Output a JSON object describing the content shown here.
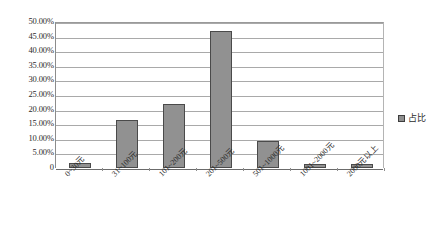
{
  "chart_data": {
    "type": "bar",
    "title": "",
    "subtitle": "",
    "xlabel": "",
    "ylabel": "",
    "categories": [
      "0~30元",
      "31~100元",
      "101~200元",
      "201~500元",
      "501~1000元",
      "1001~2000元",
      "2000元以上"
    ],
    "values": [
      1.7,
      16.3,
      22.0,
      47.0,
      9.2,
      1.5,
      1.5
    ],
    "series": [
      {
        "name": "占比",
        "values": [
          1.7,
          16.3,
          22.0,
          47.0,
          9.2,
          1.5,
          1.5
        ]
      }
    ],
    "ylim": [
      0,
      50
    ],
    "ytick_labels": [
      "50.00%",
      "45.00%",
      "40.00%",
      "35.00%",
      "30.00%",
      "25.00%",
      "20.00%",
      "15.00%",
      "10.00%",
      "5.00%",
      "0"
    ],
    "ytick_values": [
      50,
      45,
      40,
      35,
      30,
      25,
      20,
      15,
      10,
      5,
      0
    ],
    "grid": true,
    "legend": {
      "position": "right",
      "entries": [
        {
          "label": "占比",
          "color": "#919191",
          "marker": "legend-swatch-icon"
        }
      ]
    },
    "bar_color": "#919191",
    "bar_border_color": "#4a4a4a",
    "gridline_color": "#a9a9a9",
    "axis_color": "#6b6b6b",
    "background_color": "#ffffff",
    "xlabel_rotation": -45
  }
}
